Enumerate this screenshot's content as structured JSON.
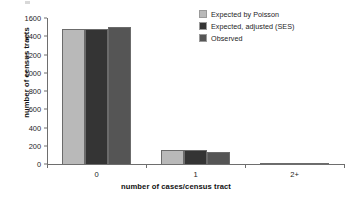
{
  "chart_data": {
    "type": "bar",
    "title": "",
    "xlabel": "number of cases/census tract",
    "ylabel": "number of census tracts",
    "categories": [
      "0",
      "1",
      "2+"
    ],
    "series": [
      {
        "name": "Expected by Poisson",
        "color": "#b9b9b9",
        "values": [
          1480,
          155,
          5
        ]
      },
      {
        "name": "Expected, adjusted (SES)",
        "color": "#343434",
        "values": [
          1480,
          155,
          5
        ]
      },
      {
        "name": "Observed",
        "color": "#555555",
        "values": [
          1500,
          135,
          15
        ]
      }
    ],
    "ylim": [
      0,
      1600
    ],
    "yticks": [
      0,
      200,
      400,
      600,
      800,
      1000,
      1200,
      1400,
      1600
    ],
    "ytick_labels": [
      "0",
      "200",
      "400",
      "600",
      "800",
      "1000",
      "1200",
      "1400",
      "1600"
    ],
    "grid": false,
    "legend_position": "top-right"
  }
}
